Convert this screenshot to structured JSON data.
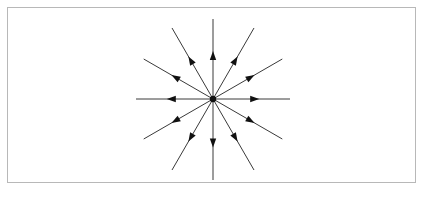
{
  "figure": {
    "background_color": "#ffffff",
    "frame": {
      "name": "image-border",
      "x": 7,
      "y": 7,
      "width": 409,
      "height": 176,
      "stroke_color": "#b8b8b8",
      "stroke_width": 1
    }
  },
  "chart_data": {
    "type": "scatter",
    "title": "",
    "subtitle": "",
    "xlabel": "",
    "ylabel": "",
    "grid": false,
    "legend": null,
    "annotations": [],
    "plot_style": "vector-field-radial-starburst",
    "center": {
      "x": 213,
      "y": 99
    },
    "center_dot_radius": 3.2,
    "ray_count": 12,
    "angle_step_degrees": 30,
    "arrow_direction": "outward",
    "arrowhead_position_fraction": 0.6,
    "line_color": "#3a3a3a",
    "arrow_color": "#111111",
    "line_width": 1,
    "rays": [
      {
        "label": "E",
        "angle_deg": 0,
        "length": 77
      },
      {
        "label": "ENE",
        "angle_deg": 30,
        "length": 80
      },
      {
        "label": "NNE",
        "angle_deg": 60,
        "length": 82
      },
      {
        "label": "N",
        "angle_deg": 90,
        "length": 80
      },
      {
        "label": "NNW",
        "angle_deg": 120,
        "length": 82
      },
      {
        "label": "WNW",
        "angle_deg": 150,
        "length": 80
      },
      {
        "label": "W",
        "angle_deg": 180,
        "length": 77
      },
      {
        "label": "WSW",
        "angle_deg": 210,
        "length": 80
      },
      {
        "label": "SSW",
        "angle_deg": 240,
        "length": 82
      },
      {
        "label": "S",
        "angle_deg": 270,
        "length": 81
      },
      {
        "label": "SSE",
        "angle_deg": 300,
        "length": 82
      },
      {
        "label": "ESE",
        "angle_deg": 330,
        "length": 80
      }
    ],
    "arrowhead": {
      "length": 9,
      "half_width": 3.2
    }
  }
}
